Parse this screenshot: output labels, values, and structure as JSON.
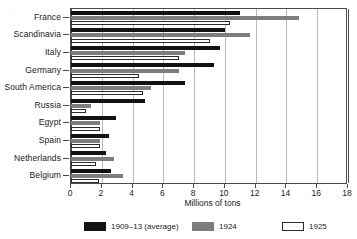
{
  "chart_data": {
    "type": "bar",
    "orientation": "horizontal",
    "title": "",
    "xlabel": "Millions of tons",
    "ylabel": "",
    "xlim": [
      0,
      18
    ],
    "xticks": [
      0,
      2,
      4,
      6,
      8,
      10,
      12,
      14,
      16,
      18
    ],
    "grid": true,
    "legend_position": "bottom",
    "categories": [
      "France",
      "Scandinavia",
      "Italy",
      "Germany",
      "South America",
      "Russia",
      "Egypt",
      "Spain",
      "Netherlands",
      "Belgium"
    ],
    "series": [
      {
        "name": "1909–13 (average)",
        "color": "#121212",
        "values": [
          11.0,
          10.0,
          9.7,
          9.3,
          7.4,
          4.8,
          2.9,
          2.5,
          2.3,
          2.6
        ]
      },
      {
        "name": "1924",
        "color": "#7d7d7d",
        "values": [
          14.8,
          11.6,
          7.4,
          7.0,
          5.2,
          1.3,
          1.9,
          1.9,
          2.8,
          3.4
        ]
      },
      {
        "name": "1925",
        "color": "#ffffff",
        "values": [
          10.3,
          9.0,
          7.0,
          4.4,
          4.7,
          1.0,
          1.9,
          1.9,
          1.6,
          1.8
        ]
      }
    ]
  },
  "axis": {
    "x_title": "Millions of tons",
    "tick_labels": [
      "0",
      "2",
      "4",
      "6",
      "8",
      "10",
      "12",
      "14",
      "16",
      "18"
    ]
  },
  "legend": {
    "items": [
      {
        "label": "1909–13 (average)",
        "color": "#121212"
      },
      {
        "label": "1924",
        "color": "#7d7d7d"
      },
      {
        "label": "1925",
        "color": "#ffffff"
      }
    ]
  },
  "marks": {
    "corner": "·"
  }
}
